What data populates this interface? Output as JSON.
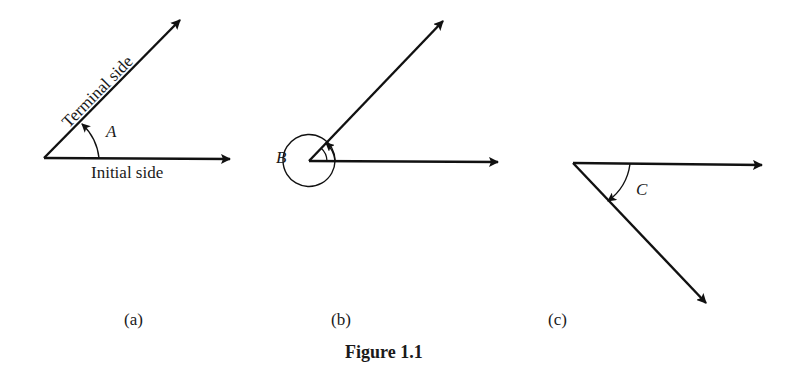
{
  "figure": {
    "caption": "Figure 1.1",
    "panels": [
      {
        "id": "a",
        "sublabel": "(a)",
        "angle_label": "A",
        "initial_side_label": "Initial side",
        "terminal_side_label": "Terminal side",
        "description": "Positive angle A measured counterclockwise from initial side to terminal side"
      },
      {
        "id": "b",
        "sublabel": "(b)",
        "angle_label": "B",
        "description": "Angle B with more than one full counterclockwise revolution"
      },
      {
        "id": "c",
        "sublabel": "(c)",
        "angle_label": "C",
        "description": "Negative angle C measured clockwise"
      }
    ]
  },
  "colors": {
    "stroke": "#111111",
    "background": "#ffffff"
  }
}
